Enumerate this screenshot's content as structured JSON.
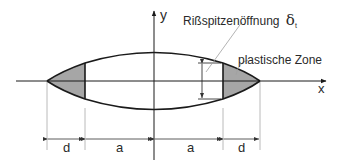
{
  "diagram": {
    "type": "crack-tip-opening-displacement",
    "labels": {
      "y_axis": "y",
      "x_axis": "x",
      "ctod": "Rißspitzenöffnung",
      "ctod_symbol": "δ",
      "ctod_subscript": "t",
      "plastic_zone": "plastische Zone"
    },
    "dimensions": [
      {
        "label": "d"
      },
      {
        "label": "a"
      },
      {
        "label": "a"
      },
      {
        "label": "d"
      }
    ],
    "colors": {
      "line": "#1a1a1a",
      "thin_line": "#9a9a9a",
      "plastic_fill": "#a6a6a6",
      "text": "#2a2a2a"
    }
  }
}
